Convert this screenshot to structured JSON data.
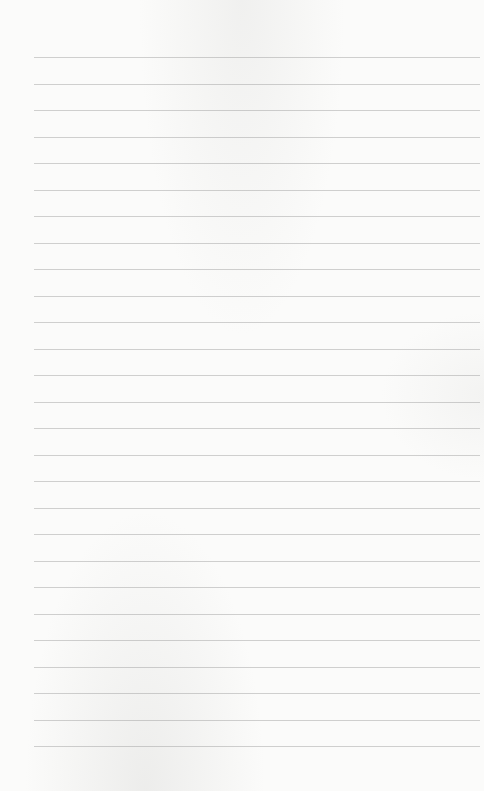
{
  "page": {
    "type": "ruled-paper",
    "ruled_lines": 27,
    "line_color": "#9a9a98",
    "background_color": "#fbfbfa"
  }
}
